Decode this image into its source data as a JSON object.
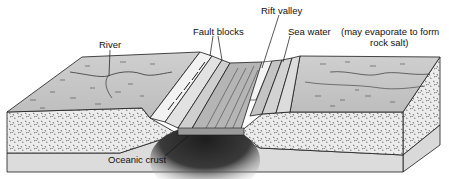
{
  "diagram": {
    "labels": {
      "river": "River",
      "fault_blocks": "Fault blocks",
      "rift_valley": "Rift valley",
      "sea_water": "Sea water",
      "evaporate_line1": "(may evaporate to form",
      "evaporate_line2": "rock salt)",
      "oceanic_crust": "Oceanic crust"
    },
    "colors": {
      "surface": "#c8c8c8",
      "sediment": "#e6e6e6",
      "crust": "#d9d9d9",
      "magma": "#2a2a2a",
      "outline": "#1a1a1a"
    }
  }
}
